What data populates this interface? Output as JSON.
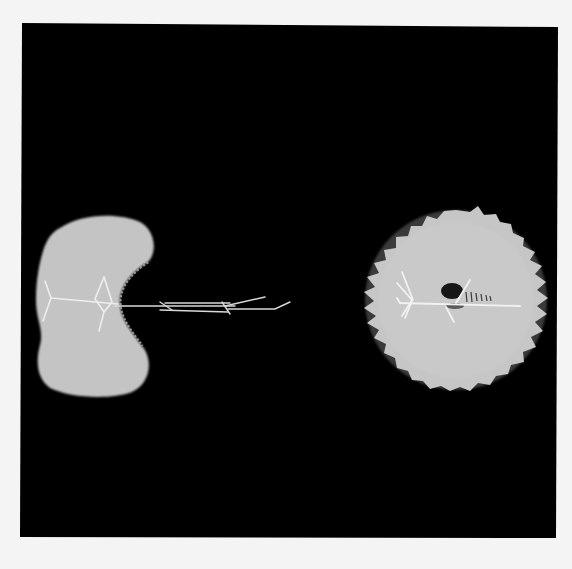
{
  "figure": {
    "background_color": "#f4f4f4",
    "panel": {
      "color": "#000000",
      "x": 22,
      "y": 24,
      "width": 535,
      "height": 514
    },
    "left_blob": {
      "shape": "kidney",
      "fill": "#c4c4c4",
      "bbox": {
        "x": 35,
        "y": 215,
        "width": 120,
        "height": 182
      }
    },
    "right_blob": {
      "shape": "spiky-ellipse",
      "fill": "#c6c6c6",
      "cx": 456,
      "cy": 300,
      "rx": 91,
      "ry": 90,
      "dark_spot": {
        "cx": 452,
        "cy": 291,
        "rx": 11,
        "ry": 8,
        "color": "#151515"
      }
    },
    "filament_color": "#f2f2f2"
  }
}
